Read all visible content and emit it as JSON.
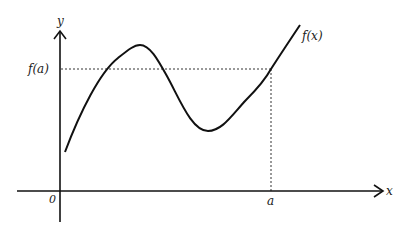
{
  "diagram": {
    "type": "function-graph",
    "labels": {
      "y_axis": "y",
      "x_axis": "x",
      "origin": "0",
      "curve": "f(x)",
      "point_x": "a",
      "point_y": "f(a)"
    },
    "colors": {
      "ink": "#111111",
      "background": "#ffffff"
    }
  }
}
